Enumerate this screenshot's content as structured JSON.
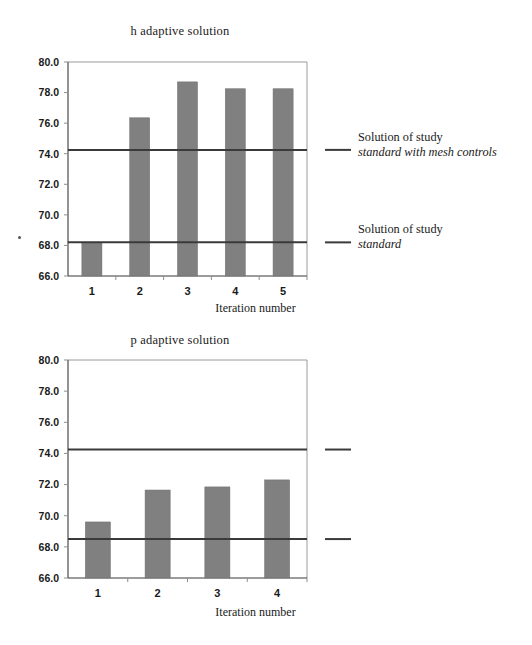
{
  "page": {
    "background": "#ffffff",
    "bar_color": "#808080",
    "line_color": "#3a3a3a",
    "frame_color": "#9a9a9a"
  },
  "annotations": {
    "mesh": {
      "line1": "Solution of study",
      "line2": "standard with mesh controls"
    },
    "standard": {
      "line1": "Solution of study",
      "line2": "standard"
    }
  },
  "chart_data": [
    {
      "id": "h-adaptive",
      "type": "bar",
      "title": "h adaptive solution",
      "xlabel": "Iteration number",
      "ylabel": "",
      "categories": [
        "1",
        "2",
        "3",
        "4",
        "5"
      ],
      "values": [
        68.2,
        76.35,
        78.7,
        78.25,
        78.25
      ],
      "ylim": [
        66.0,
        80.0
      ],
      "yticks": [
        66.0,
        68.0,
        70.0,
        72.0,
        74.0,
        76.0,
        78.0,
        80.0
      ],
      "ytick_labels": [
        "66.0",
        "68.0",
        "70.0",
        "72.0",
        "74.0",
        "76.0",
        "78.0",
        "80.0"
      ],
      "grid": false,
      "legend_position": "right-outside",
      "reference_lines": [
        {
          "name": "standard with mesh controls",
          "value": 74.25
        },
        {
          "name": "standard",
          "value": 68.2
        }
      ]
    },
    {
      "id": "p-adaptive",
      "type": "bar",
      "title": "p adaptive solution",
      "xlabel": "Iteration number",
      "ylabel": "",
      "categories": [
        "1",
        "2",
        "3",
        "4"
      ],
      "values": [
        69.6,
        71.65,
        71.85,
        72.3
      ],
      "ylim": [
        66.0,
        80.0
      ],
      "yticks": [
        66.0,
        68.0,
        70.0,
        72.0,
        74.0,
        76.0,
        78.0,
        80.0
      ],
      "ytick_labels": [
        "66.0",
        "68.0",
        "70.0",
        "72.0",
        "74.0",
        "76.0",
        "78.0",
        "80.0"
      ],
      "grid": false,
      "legend_position": "right-outside",
      "reference_lines": [
        {
          "name": "standard with mesh controls",
          "value": 74.25
        },
        {
          "name": "standard",
          "value": 68.5
        }
      ]
    }
  ]
}
